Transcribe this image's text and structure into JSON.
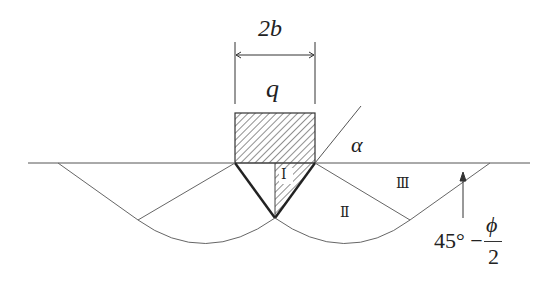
{
  "diagram": {
    "width_label": "2b",
    "load_label": "q",
    "angle_alpha_label": "α",
    "zones": {
      "zone_1": "Ⅰ",
      "zone_2": "Ⅱ",
      "zone_3": "Ⅲ"
    },
    "angle_label": {
      "prefix": "45° −",
      "numerator": "ϕ",
      "denominator": "2"
    },
    "colors": {
      "line": "#555555",
      "bold_line": "#222222",
      "hatch": "#444444"
    }
  }
}
